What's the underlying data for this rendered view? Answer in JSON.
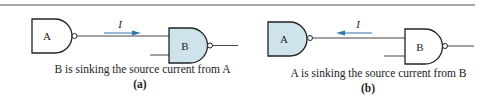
{
  "figure": {
    "panels": [
      {
        "id": "a",
        "label": "(a)",
        "caption": "B is sinking the source current from A",
        "gate_left": {
          "label": "A",
          "highlighted": false
        },
        "gate_right": {
          "label": "B",
          "highlighted": true
        },
        "current_label": "I",
        "current_direction": "right"
      },
      {
        "id": "b",
        "label": "(b)",
        "caption": "A is sinking the source current from B",
        "gate_left": {
          "label": "A",
          "highlighted": true
        },
        "gate_right": {
          "label": "B",
          "highlighted": false
        },
        "current_label": "I",
        "current_direction": "left"
      }
    ],
    "colors": {
      "highlight_fill": "#cfe3ec",
      "arrow": "#2e77a8",
      "line": "#222222",
      "rule": "#888888"
    }
  }
}
